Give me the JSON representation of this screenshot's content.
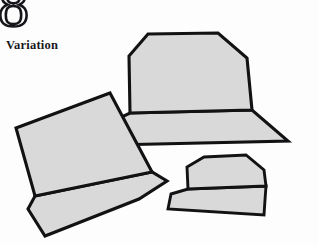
{
  "page": {
    "background_color": "#fdfdfd",
    "chapter_number": "8",
    "caption": "Variation"
  },
  "illustration": {
    "name": "three-hats-illustration",
    "description": "Three gray hats drawn as flat polygons, each with a crown and a brim, shown at different angles and sizes",
    "fill_color": "#d9d9d9",
    "outline_color": "#121214",
    "outline_width": 3.1,
    "shapes": [
      {
        "name": "large-hat",
        "position": "upper-right",
        "crown_points": "148,34 218,33 247,58 252,110 130,113 129,56",
        "brim_points": "130,113 252,110 288,141 113,145 111,122"
      },
      {
        "name": "tilted-hat",
        "position": "left",
        "crown_points": "110,93 152,172 35,196 16,128",
        "brim_points": "35,196 152,172 167,181 139,199 45,236 28,209"
      },
      {
        "name": "small-hat",
        "position": "lower-right",
        "crown_points": "204,157 246,155 264,170 266,186 188,189 187,167"
      }
    ]
  }
}
